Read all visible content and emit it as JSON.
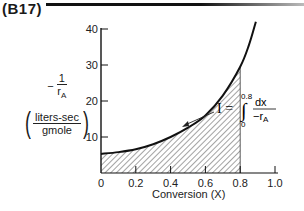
{
  "figure": {
    "label": "(B17)"
  },
  "y_axis": {
    "label_numerator": "1",
    "label_denominator": "r",
    "label_denominator_sub": "A",
    "label_minus": "−",
    "units_numerator": "liters-sec",
    "units_denominator": "gmole",
    "ticks": [
      "0",
      "10",
      "20",
      "30",
      "40"
    ]
  },
  "x_axis": {
    "title": "Conversion (X)",
    "ticks": [
      "0",
      "0.2",
      "0.4",
      "0.6",
      "0.8",
      "1.0"
    ]
  },
  "annotation": {
    "symbol": "I =",
    "upper_limit": "0.8",
    "lower_limit": "0",
    "numerator": "dx",
    "denominator": "−r",
    "denominator_sub": "A"
  },
  "chart_data": {
    "type": "area",
    "title": "(B17)",
    "xlabel": "Conversion (X)",
    "ylabel": "−1/r_A (liters-sec/gmole)",
    "xlim": [
      0,
      1.0
    ],
    "ylim": [
      0,
      40
    ],
    "xticks": [
      0,
      0.2,
      0.4,
      0.6,
      0.8,
      1.0
    ],
    "yticks": [
      0,
      10,
      20,
      30,
      40
    ],
    "grid": false,
    "series": [
      {
        "name": "-1/r_A curve",
        "x": [
          0,
          0.1,
          0.2,
          0.3,
          0.4,
          0.5,
          0.6,
          0.7,
          0.8,
          0.85,
          0.89
        ],
        "values": [
          5.3,
          5.8,
          6.6,
          8.0,
          10.0,
          12.6,
          16.0,
          21.5,
          29.5,
          35.5,
          42.0
        ]
      }
    ],
    "shaded_region": {
      "from_x": 0,
      "to_x": 0.8,
      "pattern": "diagonal hatch",
      "label": "I = ∫₀^0.8 dx/(−r_A)"
    },
    "annotations": [
      "I = ∫ from 0 to 0.8 of dx / (−r_A)"
    ]
  }
}
